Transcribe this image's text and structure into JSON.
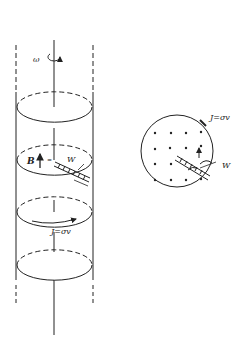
{
  "diagram": {
    "type": "physics-illustration",
    "left_figure": {
      "labels": {
        "omega": "ω",
        "B": "B",
        "W": "W",
        "current": "J=σv"
      }
    },
    "right_figure": {
      "labels": {
        "current": "J=σv",
        "W": "W"
      },
      "field_dot_rows": 4,
      "field_dot_cols": 4
    },
    "colors": {
      "stroke": "#222222",
      "background": "#ffffff"
    }
  }
}
